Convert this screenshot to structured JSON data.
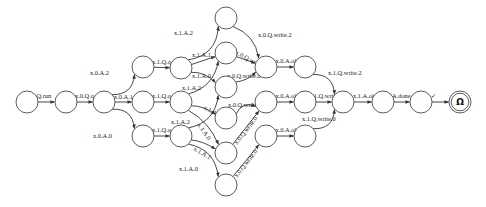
{
  "diagram": {
    "type": "state-machine",
    "nodes": [
      {
        "id": "n0",
        "label": ""
      },
      {
        "id": "n1",
        "label": ""
      },
      {
        "id": "n2",
        "label": ""
      },
      {
        "id": "a2",
        "label": ""
      },
      {
        "id": "a1",
        "label": ""
      },
      {
        "id": "a0",
        "label": ""
      },
      {
        "id": "b2",
        "label": ""
      },
      {
        "id": "b1",
        "label": ""
      },
      {
        "id": "b0",
        "label": ""
      },
      {
        "id": "c22",
        "label": ""
      },
      {
        "id": "c21",
        "label": ""
      },
      {
        "id": "c20",
        "label": ""
      },
      {
        "id": "c11",
        "label": ""
      },
      {
        "id": "c10",
        "label": ""
      },
      {
        "id": "c00",
        "label": ""
      },
      {
        "id": "d2",
        "label": ""
      },
      {
        "id": "d1",
        "label": ""
      },
      {
        "id": "d0",
        "label": ""
      },
      {
        "id": "e2",
        "label": ""
      },
      {
        "id": "e1",
        "label": ""
      },
      {
        "id": "e0",
        "label": ""
      },
      {
        "id": "f",
        "label": ""
      },
      {
        "id": "g",
        "label": ""
      },
      {
        "id": "h",
        "label": ""
      },
      {
        "id": "omega",
        "label": "Ω",
        "final": true
      }
    ],
    "edges": [
      {
        "from": "n0",
        "to": "n1",
        "label": "Q.run"
      },
      {
        "from": "n1",
        "to": "n2",
        "label": "x.0.Q.q"
      },
      {
        "from": "n2",
        "to": "a2",
        "label": "x.0.A.2"
      },
      {
        "from": "n2",
        "to": "a1",
        "label": "x.0.A.1"
      },
      {
        "from": "n2",
        "to": "a0",
        "label": "x.0.A.0"
      },
      {
        "from": "a2",
        "to": "b2",
        "label": "x.1.Q.q"
      },
      {
        "from": "a1",
        "to": "b1",
        "label": "x.1.Q.q"
      },
      {
        "from": "a0",
        "to": "b0",
        "label": "x.1.Q.q"
      },
      {
        "from": "b2",
        "to": "c22",
        "label": "x.1.A.2"
      },
      {
        "from": "b2",
        "to": "c21",
        "label": "x.1.A.1"
      },
      {
        "from": "b2",
        "to": "c20",
        "label": "x.1.A.0"
      },
      {
        "from": "b1",
        "to": "c21",
        "label": "x.1.A.2"
      },
      {
        "from": "b1",
        "to": "c11",
        "label": "x.1.A.1"
      },
      {
        "from": "b1",
        "to": "c10",
        "label": "x.1.A.0"
      },
      {
        "from": "b0",
        "to": "c20",
        "label": "x.1.A.2"
      },
      {
        "from": "b0",
        "to": "c10",
        "label": "x.1.A.1"
      },
      {
        "from": "b0",
        "to": "c00",
        "label": "x.1.A.0"
      },
      {
        "from": "c22",
        "to": "d2",
        "label": "x.0.Q.write.2"
      },
      {
        "from": "c21",
        "to": "d2",
        "label": "x.0.Q.write.1"
      },
      {
        "from": "c20",
        "to": "d2",
        "label": "x.0.Q.write.0"
      },
      {
        "from": "c11",
        "to": "d1",
        "label": "x.0.Q.write.1"
      },
      {
        "from": "c10",
        "to": "d1",
        "label": "x.0.Q.write.0"
      },
      {
        "from": "c00",
        "to": "d0",
        "label": "x.0.Q.write.0"
      },
      {
        "from": "d2",
        "to": "e2",
        "label": "x.0.A.ok"
      },
      {
        "from": "d1",
        "to": "e1",
        "label": "x.0.A.ok"
      },
      {
        "from": "d0",
        "to": "e0",
        "label": "x.0.A.ok"
      },
      {
        "from": "e2",
        "to": "f",
        "label": "x.1.Q.write.2"
      },
      {
        "from": "e1",
        "to": "f",
        "label": "x.1.Q.write.1"
      },
      {
        "from": "e0",
        "to": "f",
        "label": "x.1.Q.write.0"
      },
      {
        "from": "f",
        "to": "g",
        "label": "x.1.A.ok"
      },
      {
        "from": "g",
        "to": "h",
        "label": "A.done"
      },
      {
        "from": "h",
        "to": "omega",
        "label": "✓"
      }
    ]
  }
}
